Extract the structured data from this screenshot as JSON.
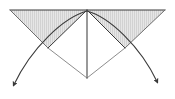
{
  "figure": {
    "kind": "geometry-diagram",
    "width": 175,
    "height": 99,
    "background_color": "#ffffff",
    "title": "",
    "caption": "",
    "labels": [],
    "colors": {
      "stroke_dark": "#3a3a3a",
      "stroke_mid": "#6e6e6e",
      "stroke_light": "#8d8d8d",
      "fill_shade": "#e3e3e3",
      "hatch_line": "#b9b9b9"
    },
    "points": {
      "apex": {
        "x": 87,
        "y": 10
      },
      "top_left_corner": {
        "x": 10,
        "y": 10
      },
      "top_right_corner": {
        "x": 165,
        "y": 10
      },
      "left_inner_vertex": {
        "x": 48,
        "y": 48
      },
      "right_inner_vertex": {
        "x": 125,
        "y": 48
      },
      "bottom_vertex": {
        "x": 87,
        "y": 78
      },
      "left_arrow_tip": {
        "x": 10,
        "y": 89
      },
      "right_arrow_tip": {
        "x": 161,
        "y": 86
      }
    },
    "elements": [
      {
        "name": "left-shaded-triangle",
        "role": "hatched-region"
      },
      {
        "name": "right-shaded-triangle",
        "role": "hatched-region"
      },
      {
        "name": "top-edge",
        "role": "straight-line"
      },
      {
        "name": "left-outer-ray",
        "role": "straight-line"
      },
      {
        "name": "right-outer-ray",
        "role": "straight-line"
      },
      {
        "name": "left-inner-ray",
        "role": "straight-line"
      },
      {
        "name": "right-inner-ray",
        "role": "straight-line"
      },
      {
        "name": "center-vertical-line",
        "role": "straight-line"
      },
      {
        "name": "left-arc-arrow",
        "role": "curved-arrow"
      },
      {
        "name": "right-arc-arrow",
        "role": "curved-arrow"
      }
    ]
  }
}
